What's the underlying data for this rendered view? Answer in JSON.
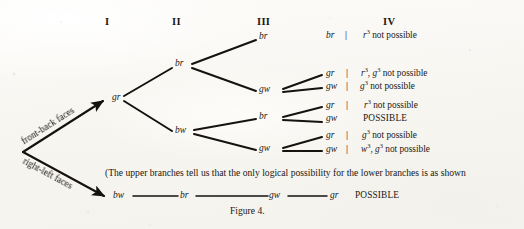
{
  "figure": {
    "caption": "Figure 4.",
    "column_headers": [
      "I",
      "II",
      "III",
      "IV"
    ],
    "axis_arrows": [
      {
        "label": "front-back faces",
        "direction": "up-right"
      },
      {
        "label": "right-left faces",
        "direction": "down-right"
      }
    ],
    "root_node": "gr",
    "level2_nodes": [
      "br",
      "bw"
    ],
    "level3_nodes": [
      "br",
      "gw",
      "br",
      "gw"
    ],
    "leaves": [
      {
        "node": "br",
        "separator": "|",
        "reason_html": "<i>r</i><sup>3</sup> not possible",
        "reason_text": "r3 not possible"
      },
      {
        "node": "gr",
        "separator": "|",
        "reason_html": "<i>r</i><sup>3</sup>, <i>g</i><sup>3</sup> not possible",
        "reason_text": "r3, g3 not possible"
      },
      {
        "node": "gw",
        "separator": "|",
        "reason_html": "<i>g</i><sup>3</sup> not possible",
        "reason_text": "g3 not possible"
      },
      {
        "node": "gr",
        "separator": "|",
        "reason_html": "<i>r</i><sup>3</sup> not possible",
        "reason_text": "r3 not possible"
      },
      {
        "node": "gw",
        "separator": "",
        "reason_html": "POSSIBLE",
        "reason_text": "POSSIBLE"
      },
      {
        "node": "gr",
        "separator": "|",
        "reason_html": "<i>g</i><sup>3</sup> not possible",
        "reason_text": "g3 not possible"
      },
      {
        "node": "gw",
        "separator": "|",
        "reason_html": "<i>w</i><sup>3</sup>, <i>g</i><sup>3</sup> not possible",
        "reason_text": "w3, g3 not possible"
      }
    ],
    "note": "(The upper branches tell us that the only logical possibility for the lower branches is as shown",
    "bottom_chain": {
      "nodes": [
        "bw",
        "br",
        "gw",
        "gr"
      ],
      "result": "POSSIBLE"
    },
    "ink_color": "#15120f",
    "paper_color": "#faf8f4"
  }
}
